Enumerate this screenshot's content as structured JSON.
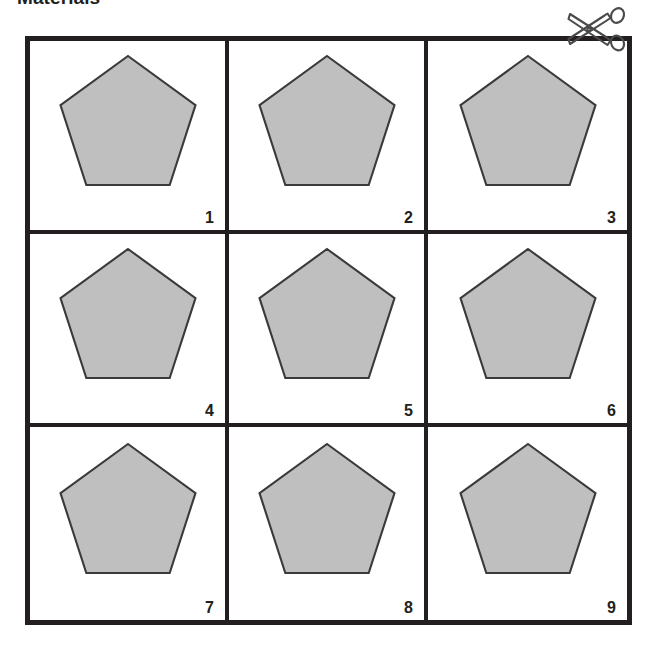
{
  "page": {
    "title": "Materials",
    "background_color": "#ffffff"
  },
  "colors": {
    "shape_fill": "#bfbfbf",
    "shape_stroke": "#3a3a3a",
    "grid_line": "#231f20",
    "text": "#231f20",
    "scissors": "#4a4a4a"
  },
  "cut_marker": {
    "icon": "scissors-icon",
    "position": "top-right"
  },
  "grid": {
    "rows": 3,
    "columns": 3,
    "outer_border_px": 5,
    "inner_border_px": 4,
    "cells": [
      {
        "number": "1",
        "shape": "pentagon",
        "sides": 5,
        "fill": "#bfbfbf"
      },
      {
        "number": "2",
        "shape": "pentagon",
        "sides": 5,
        "fill": "#bfbfbf"
      },
      {
        "number": "3",
        "shape": "pentagon",
        "sides": 5,
        "fill": "#bfbfbf"
      },
      {
        "number": "4",
        "shape": "pentagon",
        "sides": 5,
        "fill": "#bfbfbf"
      },
      {
        "number": "5",
        "shape": "pentagon",
        "sides": 5,
        "fill": "#bfbfbf"
      },
      {
        "number": "6",
        "shape": "pentagon",
        "sides": 5,
        "fill": "#bfbfbf"
      },
      {
        "number": "7",
        "shape": "pentagon",
        "sides": 5,
        "fill": "#bfbfbf"
      },
      {
        "number": "8",
        "shape": "pentagon",
        "sides": 5,
        "fill": "#bfbfbf"
      },
      {
        "number": "9",
        "shape": "pentagon",
        "sides": 5,
        "fill": "#bfbfbf"
      }
    ]
  }
}
